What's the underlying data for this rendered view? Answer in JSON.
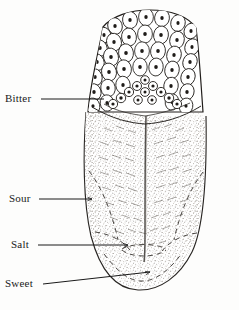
{
  "figure": {
    "style": "engraved line drawing, black ink on off-white paper",
    "background_color": "#fdfdfc",
    "ink_color": "#1a1a1a"
  },
  "labels": [
    {
      "id": "bitter",
      "text": "Bitter",
      "x": 5,
      "y": 93,
      "zone": "posterior / back of tongue"
    },
    {
      "id": "sour",
      "text": "Sour",
      "x": 9,
      "y": 193,
      "zone": "lateral mid / sides"
    },
    {
      "id": "salt",
      "text": "Salt",
      "x": 11,
      "y": 239,
      "zone": "lateral anterior"
    },
    {
      "id": "sweet",
      "text": "Sweet",
      "x": 5,
      "y": 278,
      "zone": "apex / tip"
    }
  ],
  "leader_lines": [
    {
      "id": "bitter-leader",
      "x1": 41,
      "y1": 99,
      "x2": 104,
      "y2": 99
    },
    {
      "id": "sour-leader",
      "x1": 39,
      "y1": 199,
      "x2": 92,
      "y2": 199
    },
    {
      "id": "salt-leader",
      "x1": 38,
      "y1": 245,
      "x2": 128,
      "y2": 245
    },
    {
      "id": "sweet-leader",
      "x1": 43,
      "y1": 284,
      "x2": 150,
      "y2": 272
    }
  ],
  "anatomy": {
    "papillae_field_label": "filiform and foliate papillae field (root of tongue)",
    "circumvallate_row_label": "V-shaped row of circumvallate papillae",
    "median_sulcus_label": "median sulcus (central groove)",
    "body_texture_label": "stippled mucosa with feathered papillae",
    "zone_boundaries_label": "dashed taste-zone boundary arcs"
  },
  "colors": {
    "ink": "#1a1a1a",
    "ink_soft": "#3a3632",
    "stipple": "#6b6459",
    "paper": "#fdfdfc",
    "cell_fill": "#ffffff"
  }
}
